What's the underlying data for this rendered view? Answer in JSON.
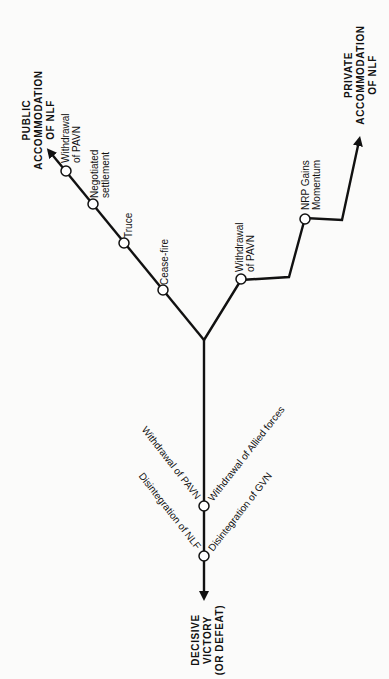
{
  "diagram": {
    "orientation": "rotated 90 degrees counter-clockwise",
    "colors": {
      "line": "#111111",
      "background": "#fbfbfa",
      "node_fill": "#ffffff"
    },
    "outcomes": {
      "public": [
        "PUBLIC",
        "ACCOMMODATION",
        "OF NLF"
      ],
      "private": [
        "PRIVATE",
        "ACCOMMODATION",
        "OF NLF"
      ],
      "decisive": [
        "DECISIVE",
        "VICTORY",
        "(OR DEFEAT)"
      ]
    },
    "public_branch_nodes": [
      {
        "label": [
          "Cease-fire"
        ]
      },
      {
        "label": [
          "Truce"
        ]
      },
      {
        "label": [
          "Negotiated",
          "settlement"
        ]
      },
      {
        "label": [
          "Withdrawal",
          "of PAVN"
        ]
      }
    ],
    "private_branch_nodes": [
      {
        "label": [
          "Withdrawal",
          "of PAVN"
        ]
      },
      {
        "label": [
          "NRP Gains",
          "Momentum"
        ]
      }
    ],
    "decisive_branch_nodes": [
      {
        "right_label": "Withdrawal of Allied forces",
        "left_label": "Withdrawal of PAVN"
      },
      {
        "right_label": "Disintegration of GVN",
        "left_label": "Disintegration of NLF"
      }
    ]
  }
}
